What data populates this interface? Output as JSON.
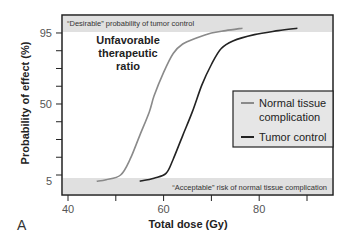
{
  "chart_data": {
    "type": "line",
    "title": "",
    "panel_label": "A",
    "xlabel": "Total dose (Gy)",
    "ylabel": "Probability of effect (%)",
    "xlim": [
      37,
      94
    ],
    "ylim": [
      0,
      100
    ],
    "x_ticks": [
      40,
      50,
      60,
      70,
      80,
      90
    ],
    "x_tick_labels": [
      "40",
      "",
      "60",
      "",
      "80",
      ""
    ],
    "y_ticks": [
      5,
      16.25,
      27.5,
      38.75,
      50,
      61.25,
      72.5,
      83.75,
      95
    ],
    "y_tick_labels": [
      "5",
      "",
      "",
      "",
      "50",
      "",
      "",
      "",
      "95"
    ],
    "grid": false,
    "legend_position": "center-right",
    "bands": [
      {
        "name": "desirable",
        "y_range": [
          95,
          100
        ],
        "label": "“Desirable” probability of tumor control",
        "color": "#e0e0e0"
      },
      {
        "name": "acceptable",
        "y_range": [
          0,
          5
        ],
        "label": "“Acceptable” risk of normal tissue complication",
        "color": "#e0e0e0"
      }
    ],
    "annotations": [
      "Unfavorable",
      "therapeutic",
      "ratio"
    ],
    "series": [
      {
        "name": "Normal tissue complication",
        "color": "#8a8a8a",
        "x": [
          46,
          48,
          51,
          53,
          55,
          57,
          58,
          60,
          62,
          64,
          67,
          70,
          73,
          76.5
        ],
        "y": [
          1,
          2,
          5,
          15,
          30,
          45,
          55,
          70,
          82,
          88,
          92,
          95,
          96.5,
          98
        ]
      },
      {
        "name": "Tumor control",
        "color": "#222222",
        "x": [
          55,
          58,
          60.5,
          62,
          64,
          66,
          68,
          70,
          72,
          74.5,
          79,
          84,
          88
        ],
        "y": [
          1,
          3,
          6,
          15,
          30,
          45,
          62,
          75,
          85,
          90,
          94,
          96.5,
          98
        ]
      }
    ]
  }
}
